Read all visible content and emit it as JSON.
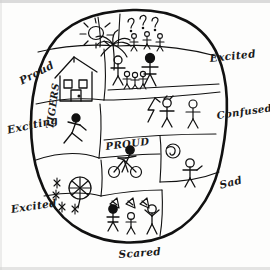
{
  "drawing": {
    "title": "Hand-drawn emotion map",
    "shape": "oval-outline",
    "ink_color": "#111111",
    "paper_color": "#fdfdfc"
  },
  "outside_labels": [
    {
      "key": "proud_left",
      "text": "Proud",
      "position": "upper-left",
      "rotation": -28
    },
    {
      "key": "exciting_left",
      "text": "Exciting",
      "position": "middle-left",
      "rotation": -12
    },
    {
      "key": "excited_bottom_left",
      "text": "Excited",
      "position": "lower-left",
      "rotation": -8
    },
    {
      "key": "scared_bottom",
      "text": "Scared",
      "position": "bottom-center",
      "rotation": -4
    },
    {
      "key": "sad_right",
      "text": "Sad",
      "position": "lower-right",
      "rotation": -14
    },
    {
      "key": "confused_right",
      "text": "Confused",
      "position": "middle-right",
      "rotation": -8
    },
    {
      "key": "excited_right",
      "text": "Excited",
      "position": "upper-right",
      "rotation": -6
    }
  ],
  "inside_labels": [
    {
      "key": "tigers",
      "text": "TIGERS",
      "orientation": "vertical",
      "cell": "left-middle-cell"
    },
    {
      "key": "proud",
      "text": "PROUD",
      "orientation": "horizontal",
      "cell": "center-cell"
    }
  ],
  "cells": [
    {
      "key": "sun-cell",
      "name": "top-left-sun-cell",
      "contents": [
        "sun-icon"
      ],
      "description": "Sun with rays"
    },
    {
      "key": "palm-cell",
      "name": "top-center-palm-cell",
      "contents": [
        "palm-tree-icon"
      ],
      "description": "Palm tree"
    },
    {
      "key": "question-cell",
      "name": "top-right-question-cell",
      "contents": [
        "question-mark-icon",
        "question-mark-icon",
        "question-mark-icon",
        "stick-figure-icon",
        "stick-figure-icon",
        "stick-figure-icon"
      ],
      "description": "Question marks above small stick figures"
    },
    {
      "key": "house-cell",
      "name": "left-house-cell",
      "contents": [
        "house-icon"
      ],
      "description": "House with two windows and a door"
    },
    {
      "key": "crowd-cell",
      "name": "right-crowd-cell",
      "contents": [
        "stick-figure-icon",
        "stick-figure-icon",
        "stick-figure-icon",
        "stick-figure-icon",
        "stick-figure-icon"
      ],
      "description": "Group of stick figures, adults and children"
    },
    {
      "key": "tigers-cell",
      "name": "left-middle-tigers-cell",
      "contents": [
        "running-stick-figure-icon"
      ],
      "description": "Running figure labelled TIGERS"
    },
    {
      "key": "lightning-cell",
      "name": "right-middle-lightning-cell",
      "contents": [
        "lightning-bolt-icon",
        "stick-figure-icon",
        "stick-figure-icon"
      ],
      "description": "Lightning bolt with two stick figures"
    },
    {
      "key": "bicycle-cell",
      "name": "center-bicycle-cell",
      "contents": [
        "bicycle-icon",
        "stick-figure-icon"
      ],
      "description": "Figure riding a bicycle, labelled PROUD"
    },
    {
      "key": "ball-cell",
      "name": "right-ball-cell",
      "contents": [
        "ball-icon",
        "stick-figure-icon"
      ],
      "description": "Swirled ball and a stick figure"
    },
    {
      "key": "pinwheel-cell",
      "name": "bottom-left-pinwheel-cell",
      "contents": [
        "pinwheel-icon",
        "sparkle-icon",
        "sparkle-icon",
        "sparkle-icon"
      ],
      "description": "Pinwheel or umbrella with sparkles"
    },
    {
      "key": "party-cell",
      "name": "bottom-center-party-cell",
      "contents": [
        "party-hat-icon",
        "party-hat-icon",
        "party-hat-icon",
        "stick-figure-icon",
        "stick-figure-icon",
        "stick-figure-icon"
      ],
      "description": "Figures with party hats / flags"
    }
  ]
}
